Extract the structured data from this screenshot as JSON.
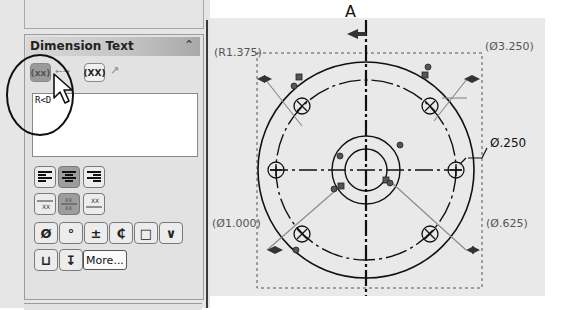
{
  "panel": {
    "section_title": "Dimension Text",
    "collapse_icon": "double-chevron-up",
    "top_buttons": [
      {
        "name": "parentheses",
        "label": "(xx)",
        "active": true
      },
      {
        "name": "center-dimension",
        "label": "←→",
        "active": false
      },
      {
        "name": "inspection",
        "label": "(XX)",
        "active": false
      },
      {
        "name": "offset-text",
        "label": "↗",
        "active": false
      }
    ],
    "text_value": "R<D",
    "justify_buttons": [
      {
        "name": "justify-left",
        "active": false
      },
      {
        "name": "justify-center",
        "active": true
      },
      {
        "name": "justify-right",
        "active": false
      }
    ],
    "stack_buttons": [
      {
        "name": "text-above",
        "active": false
      },
      {
        "name": "text-middle",
        "active": true
      },
      {
        "name": "text-below",
        "active": false
      }
    ],
    "symbols_row1": [
      "Ø",
      "°",
      "±",
      "₵",
      "□",
      "∨"
    ],
    "symbols_row1_names": [
      "diameter",
      "degree",
      "plus-minus",
      "centerline",
      "square",
      "slope"
    ],
    "symbols_row2": [
      "⊔",
      "↧"
    ],
    "symbols_row2_names": [
      "counterbore",
      "depth"
    ],
    "more_label": "More..."
  },
  "drawing": {
    "section_label": "A",
    "dimensions": {
      "radius": "R1.375",
      "outer_diameter": "Ø3.250",
      "hole_diameter": "Ø.250",
      "bolt_circle": "Ø1.000",
      "inner_diameter": "Ø.625"
    },
    "colors": {
      "line": "#111111",
      "leader": "#888888",
      "dim_text": "#555555",
      "canvas": "#e9e9e9"
    }
  }
}
